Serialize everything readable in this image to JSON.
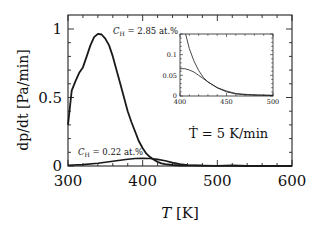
{
  "chart_data": {
    "type": "line",
    "title": "",
    "xlabel": "T [K]",
    "xlabel_var": "T",
    "xlabel_unit": "[K]",
    "ylabel": "dp/dt [Pa/min]",
    "ylabel_var": "dp/dt",
    "ylabel_unit": "[Pa/min]",
    "xlim": [
      300,
      600
    ],
    "ylim": [
      0,
      1.07
    ],
    "xticks": [
      300,
      400,
      500,
      600
    ],
    "xtick_labels": [
      "300",
      "400",
      "500",
      "600"
    ],
    "yticks": [
      0,
      0.5,
      1
    ],
    "ytick_labels": [
      "0",
      "0.5",
      "1"
    ],
    "grid": false,
    "annotations": [
      {
        "text_var": "C",
        "text_sub": "H",
        "text_rest": " = 2.85 at.%",
        "x": 390,
        "y": 0.96
      },
      {
        "text_var": "C",
        "text_sub": "H",
        "text_rest": " = 0.22 at.%",
        "x": 311,
        "y": 0.1
      },
      {
        "text": "Ṫ = 5 K/min",
        "x": 490,
        "y": 0.25
      }
    ],
    "series": [
      {
        "name": "C_H = 2.85 at.%",
        "x": [
          300,
          305,
          310,
          315,
          320,
          325,
          330,
          335,
          340,
          345,
          350,
          355,
          360,
          365,
          370,
          375,
          380,
          385,
          390,
          395,
          400,
          405,
          410,
          415,
          420,
          425,
          430,
          440,
          450,
          460,
          470,
          480,
          500,
          520,
          540,
          560,
          600
        ],
        "y": [
          0.3,
          0.55,
          0.62,
          0.68,
          0.72,
          0.8,
          0.88,
          0.94,
          0.965,
          0.96,
          0.93,
          0.88,
          0.8,
          0.7,
          0.6,
          0.5,
          0.4,
          0.32,
          0.25,
          0.18,
          0.13,
          0.09,
          0.065,
          0.045,
          0.03,
          0.02,
          0.013,
          0.007,
          0.004,
          0.003,
          0.002,
          0.002,
          0.001,
          0.001,
          0.0,
          0.0,
          0.0
        ]
      },
      {
        "name": "C_H = 0.22 at.%",
        "x": [
          300,
          320,
          340,
          360,
          380,
          390,
          400,
          410,
          420,
          430,
          440,
          450,
          460,
          480,
          500,
          520,
          540,
          560,
          600
        ],
        "y": [
          0.005,
          0.01,
          0.02,
          0.035,
          0.05,
          0.055,
          0.057,
          0.055,
          0.048,
          0.038,
          0.025,
          0.014,
          0.007,
          0.003,
          0.002,
          0.006,
          0.002,
          0.001,
          0.0
        ]
      }
    ],
    "inset": {
      "xlim": [
        400,
        500
      ],
      "ylim": [
        0,
        0.15
      ],
      "xticks": [
        400,
        450,
        500
      ],
      "xtick_labels": [
        "400",
        "450",
        "500"
      ],
      "yticks": [
        0,
        0.05,
        0.1
      ],
      "ytick_labels": [
        "0",
        "0.05",
        "0.1"
      ],
      "series": [
        {
          "name": "C_H = 2.85 at.%",
          "x": [
            406,
            410,
            415,
            420,
            425,
            430,
            440,
            450,
            460,
            470,
            480,
            490,
            500
          ],
          "y": [
            0.15,
            0.115,
            0.085,
            0.062,
            0.045,
            0.034,
            0.02,
            0.012,
            0.006,
            0.004,
            0.003,
            0.002,
            0.002
          ]
        },
        {
          "name": "C_H = 0.22 at.%",
          "x": [
            400,
            405,
            410,
            415,
            420,
            425,
            430,
            440,
            450,
            460,
            470,
            480,
            490,
            500
          ],
          "y": [
            0.066,
            0.066,
            0.063,
            0.058,
            0.05,
            0.042,
            0.034,
            0.02,
            0.01,
            0.005,
            0.003,
            0.002,
            0.002,
            0.001
          ]
        }
      ]
    }
  },
  "colors": {
    "line": "#1a1a1a",
    "axis": "#222222",
    "text": "#111111",
    "background": "#ffffff"
  }
}
